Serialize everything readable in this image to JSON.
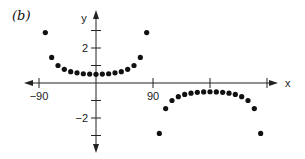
{
  "panel_label": "(b)",
  "chart_data": {
    "type": "scatter",
    "title": "",
    "panel": "(b)",
    "xlabel": "x",
    "ylabel": "y",
    "x_ticks": [
      -90,
      0,
      90,
      180,
      270
    ],
    "x_tick_labels": [
      {
        "value": -90,
        "label": "−90"
      },
      {
        "value": 90,
        "label": "90"
      }
    ],
    "y_ticks": [
      -3,
      -2,
      -1,
      1,
      2,
      3
    ],
    "y_tick_labels": [
      {
        "value": 2,
        "label": "2"
      },
      {
        "value": -2,
        "label": "−2"
      }
    ],
    "xlim": [
      -100,
      280
    ],
    "ylim": [
      -4,
      4
    ],
    "grid": false,
    "legend": null,
    "series": [
      {
        "name": "branch-1",
        "x": [
          -80,
          -70,
          -60,
          -50,
          -40,
          -30,
          -20,
          -10,
          0,
          10,
          20,
          30,
          40,
          50,
          60,
          70,
          80
        ],
        "y": [
          2.88,
          1.46,
          1.0,
          0.78,
          0.65,
          0.58,
          0.53,
          0.51,
          0.5,
          0.51,
          0.53,
          0.58,
          0.65,
          0.78,
          1.0,
          1.46,
          2.88
        ]
      },
      {
        "name": "branch-2",
        "x": [
          100,
          110,
          120,
          130,
          140,
          150,
          160,
          170,
          180,
          190,
          200,
          210,
          220,
          230,
          240,
          250,
          260
        ],
        "y": [
          -2.88,
          -1.46,
          -1.0,
          -0.78,
          -0.65,
          -0.58,
          -0.53,
          -0.51,
          -0.5,
          -0.51,
          -0.53,
          -0.58,
          -0.65,
          -0.78,
          -1.0,
          -1.46,
          -2.88
        ]
      }
    ]
  },
  "colors": {
    "axis": "#222222",
    "points": "#111111",
    "background": "#ffffff"
  }
}
